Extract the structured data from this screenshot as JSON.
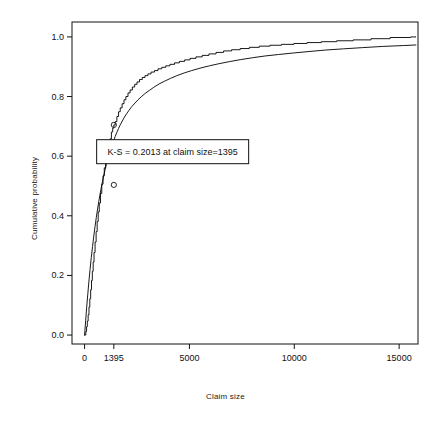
{
  "chart_data": {
    "type": "line",
    "title": "",
    "xlabel": "Claim size",
    "ylabel": "Cumulative probability",
    "xlim": [
      -600,
      15900
    ],
    "ylim": [
      -0.03,
      1.05
    ],
    "xticks": [
      0,
      1395,
      5000,
      10000,
      15000
    ],
    "xticklabels": [
      "0",
      "1395",
      "5000",
      "10000",
      "15000"
    ],
    "yticks": [
      0.0,
      0.2,
      0.4,
      0.6,
      0.8,
      1.0
    ],
    "yticklabels": [
      "0.0",
      "0.2",
      "0.4",
      "0.6",
      "0.8",
      "1.0"
    ],
    "grid": false,
    "legend": null,
    "annotation": {
      "text": "K-S = 0.2013 at claim size=1395",
      "x": 4200,
      "y": 0.615,
      "boxed": true
    },
    "markers": [
      {
        "x": 1395,
        "y": 0.7049,
        "label": "empirical-at-ks"
      },
      {
        "x": 1395,
        "y": 0.5036,
        "label": "fitted-at-ks"
      }
    ],
    "series": [
      {
        "name": "Empirical CDF (step)",
        "type": "step",
        "color": "#000000",
        "points": [
          [
            0,
            0.0
          ],
          [
            30,
            0.0
          ],
          [
            60,
            0.012
          ],
          [
            95,
            0.028
          ],
          [
            130,
            0.047
          ],
          [
            170,
            0.068
          ],
          [
            210,
            0.094
          ],
          [
            250,
            0.122
          ],
          [
            290,
            0.152
          ],
          [
            330,
            0.183
          ],
          [
            370,
            0.214
          ],
          [
            410,
            0.245
          ],
          [
            450,
            0.277
          ],
          [
            500,
            0.312
          ],
          [
            550,
            0.347
          ],
          [
            600,
            0.381
          ],
          [
            650,
            0.413
          ],
          [
            700,
            0.443
          ],
          [
            760,
            0.475
          ],
          [
            820,
            0.506
          ],
          [
            880,
            0.534
          ],
          [
            940,
            0.561
          ],
          [
            1000,
            0.586
          ],
          [
            1070,
            0.612
          ],
          [
            1140,
            0.636
          ],
          [
            1210,
            0.658
          ],
          [
            1280,
            0.681
          ],
          [
            1340,
            0.694
          ],
          [
            1395,
            0.7049
          ],
          [
            1460,
            0.716
          ],
          [
            1540,
            0.733
          ],
          [
            1620,
            0.749
          ],
          [
            1700,
            0.762
          ],
          [
            1790,
            0.776
          ],
          [
            1880,
            0.789
          ],
          [
            1970,
            0.8
          ],
          [
            2070,
            0.812
          ],
          [
            2170,
            0.822
          ],
          [
            2280,
            0.832
          ],
          [
            2390,
            0.841
          ],
          [
            2500,
            0.849
          ],
          [
            2620,
            0.857
          ],
          [
            2750,
            0.864
          ],
          [
            2880,
            0.87
          ],
          [
            3020,
            0.876
          ],
          [
            3170,
            0.882
          ],
          [
            3330,
            0.887
          ],
          [
            3500,
            0.893
          ],
          [
            3680,
            0.898
          ],
          [
            3870,
            0.903
          ],
          [
            4070,
            0.908
          ],
          [
            4290,
            0.913
          ],
          [
            4520,
            0.918
          ],
          [
            4770,
            0.923
          ],
          [
            5030,
            0.928
          ],
          [
            5310,
            0.933
          ],
          [
            5610,
            0.938
          ],
          [
            5930,
            0.943
          ],
          [
            6270,
            0.948
          ],
          [
            6630,
            0.953
          ],
          [
            7010,
            0.957
          ],
          [
            7420,
            0.961
          ],
          [
            7860,
            0.965
          ],
          [
            8330,
            0.969
          ],
          [
            8840,
            0.972
          ],
          [
            9390,
            0.975
          ],
          [
            9980,
            0.978
          ],
          [
            10610,
            0.981
          ],
          [
            11290,
            0.984
          ],
          [
            12020,
            0.987
          ],
          [
            12810,
            0.99
          ],
          [
            13660,
            0.994
          ],
          [
            14570,
            0.998
          ],
          [
            15550,
            1.0
          ],
          [
            15800,
            1.0
          ]
        ]
      },
      {
        "name": "Fitted CDF (smooth)",
        "type": "line",
        "color": "#000000",
        "points": [
          [
            0,
            0.0
          ],
          [
            50,
            0.048
          ],
          [
            100,
            0.093
          ],
          [
            150,
            0.135
          ],
          [
            200,
            0.175
          ],
          [
            260,
            0.219
          ],
          [
            320,
            0.26
          ],
          [
            380,
            0.297
          ],
          [
            440,
            0.332
          ],
          [
            500,
            0.365
          ],
          [
            560,
            0.395
          ],
          [
            620,
            0.423
          ],
          [
            680,
            0.449
          ],
          [
            740,
            0.473
          ],
          [
            800,
            0.496
          ],
          [
            860,
            0.517
          ],
          [
            920,
            0.537
          ],
          [
            980,
            0.555
          ],
          [
            1040,
            0.572
          ],
          [
            1100,
            0.588
          ],
          [
            1160,
            0.603
          ],
          [
            1220,
            0.617
          ],
          [
            1280,
            0.63
          ],
          [
            1340,
            0.643
          ],
          [
            1395,
            0.654
          ],
          [
            1460,
            0.666
          ],
          [
            1540,
            0.68
          ],
          [
            1620,
            0.693
          ],
          [
            1700,
            0.705
          ],
          [
            1800,
            0.718
          ],
          [
            1900,
            0.731
          ],
          [
            2000,
            0.742
          ],
          [
            2120,
            0.754
          ],
          [
            2250,
            0.766
          ],
          [
            2400,
            0.778
          ],
          [
            2550,
            0.789
          ],
          [
            2700,
            0.799
          ],
          [
            2900,
            0.811
          ],
          [
            3100,
            0.821
          ],
          [
            3300,
            0.831
          ],
          [
            3550,
            0.842
          ],
          [
            3800,
            0.851
          ],
          [
            4100,
            0.861
          ],
          [
            4400,
            0.87
          ],
          [
            4750,
            0.879
          ],
          [
            5100,
            0.887
          ],
          [
            5500,
            0.895
          ],
          [
            5950,
            0.903
          ],
          [
            6400,
            0.91
          ],
          [
            6900,
            0.917
          ],
          [
            7450,
            0.924
          ],
          [
            8000,
            0.93
          ],
          [
            8600,
            0.936
          ],
          [
            9250,
            0.941
          ],
          [
            9950,
            0.946
          ],
          [
            10700,
            0.951
          ],
          [
            11500,
            0.956
          ],
          [
            12350,
            0.96
          ],
          [
            13250,
            0.964
          ],
          [
            14200,
            0.968
          ],
          [
            15200,
            0.971
          ],
          [
            15800,
            0.973
          ]
        ]
      }
    ]
  },
  "axes": {
    "xlabel": "Claim size",
    "ylabel": "Cumulative probability"
  },
  "annotation": {
    "text": "K-S = 0.2013 at claim size=1395"
  },
  "xticklabels": [
    "0",
    "1395",
    "5000",
    "10000",
    "15000"
  ],
  "yticklabels": [
    "0.0",
    "0.2",
    "0.4",
    "0.6",
    "0.8",
    "1.0"
  ]
}
